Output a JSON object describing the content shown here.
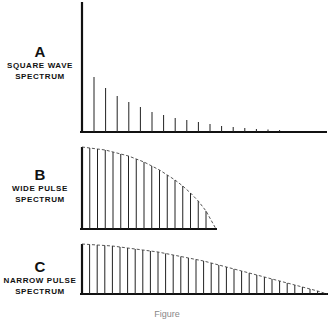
{
  "chart_data": [
    {
      "type": "bar",
      "title": "A",
      "subtitle": "SQUARE WAVE SPECTRUM",
      "description": "Discrete harmonic lines decreasing in amplitude",
      "x": [
        1,
        2,
        3,
        4,
        5,
        6,
        7,
        8,
        9,
        10,
        11,
        12,
        13,
        14,
        15,
        16,
        17
      ],
      "values": [
        55,
        44,
        36,
        30,
        25,
        20,
        17,
        14,
        12,
        10,
        8,
        6,
        5,
        4,
        3,
        2.5,
        2
      ],
      "ylim": [
        0,
        85
      ],
      "grid": false
    },
    {
      "type": "bar",
      "title": "B",
      "subtitle": "WIDE PULSE SPECTRUM",
      "description": "Harmonic lines under a dashed sinc-like envelope falling to zero",
      "x": [
        0,
        1,
        2,
        3,
        4,
        5,
        6,
        7,
        8,
        9,
        10,
        11,
        12,
        13,
        14,
        15,
        16
      ],
      "values": [
        82,
        81,
        80,
        79,
        77,
        75,
        73,
        70,
        67,
        63,
        59,
        54,
        49,
        43,
        36,
        28,
        18
      ],
      "envelope": "dashed",
      "ylim": [
        0,
        83
      ],
      "grid": false
    },
    {
      "type": "bar",
      "title": "C",
      "subtitle": "NARROW PULSE SPECTRUM",
      "description": "Closely spaced harmonic lines under a dashed envelope decaying slowly",
      "x": [
        0,
        1,
        2,
        3,
        4,
        5,
        6,
        7,
        8,
        9,
        10,
        11,
        12,
        13,
        14,
        15,
        16,
        17,
        18,
        19,
        20,
        21,
        22,
        23,
        24,
        25,
        26,
        27,
        28,
        29,
        30,
        31
      ],
      "values": [
        50,
        49.5,
        49,
        48.5,
        48,
        47,
        46,
        45,
        44,
        43,
        42,
        40.5,
        39,
        37.5,
        36,
        34.5,
        33,
        31,
        29,
        27,
        25,
        23,
        21,
        19,
        17,
        15,
        13,
        11,
        9,
        7,
        5,
        3
      ],
      "envelope": "dashed",
      "ylim": [
        0,
        50
      ],
      "grid": false
    }
  ],
  "panels": {
    "a": {
      "letter": "A",
      "line1": "SQUARE WAVE",
      "line2": "SPECTRUM"
    },
    "b": {
      "letter": "B",
      "line1": "WIDE PULSE",
      "line2": "SPECTRUM"
    },
    "c": {
      "letter": "C",
      "line1": "NARROW PULSE",
      "line2": "SPECTRUM"
    }
  },
  "caption": "Figure"
}
